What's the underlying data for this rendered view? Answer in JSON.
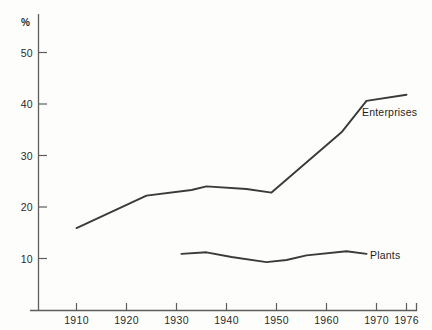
{
  "chart_data": {
    "type": "line",
    "title": "",
    "subtitle": "",
    "xlabel": "",
    "ylabel": "%",
    "ylim": [
      0,
      55
    ],
    "xlim": [
      1905,
      1978
    ],
    "grid": false,
    "legend_position": "inline-right-of-series",
    "y_ticks": [
      10,
      20,
      30,
      40,
      50
    ],
    "y_tick_labels": [
      "10",
      "20",
      "30",
      "40",
      "50"
    ],
    "x_ticks": [
      1910,
      1920,
      1930,
      1940,
      1950,
      1960,
      1970,
      1976
    ],
    "x_tick_labels": [
      "1910",
      "1920",
      "1930",
      "1940",
      "1950",
      "1960",
      "1970",
      "1976"
    ],
    "series": [
      {
        "name": "Enterprises",
        "label": "Enterprises",
        "color": "#3a3a3a",
        "x": [
          1910,
          1924,
          1933,
          1936,
          1944,
          1949,
          1963,
          1968,
          1976
        ],
        "values": [
          15.9,
          22.2,
          23.3,
          24.0,
          23.5,
          22.8,
          34.5,
          40.6,
          41.8
        ]
      },
      {
        "name": "Plants",
        "label": "Plants",
        "color": "#3a3a3a",
        "x": [
          1931,
          1936,
          1941,
          1948,
          1952,
          1956,
          1964,
          1968
        ],
        "values": [
          10.9,
          11.2,
          10.3,
          9.3,
          9.7,
          10.6,
          11.4,
          10.9
        ]
      }
    ]
  },
  "axes": {
    "unit_label": "%"
  }
}
